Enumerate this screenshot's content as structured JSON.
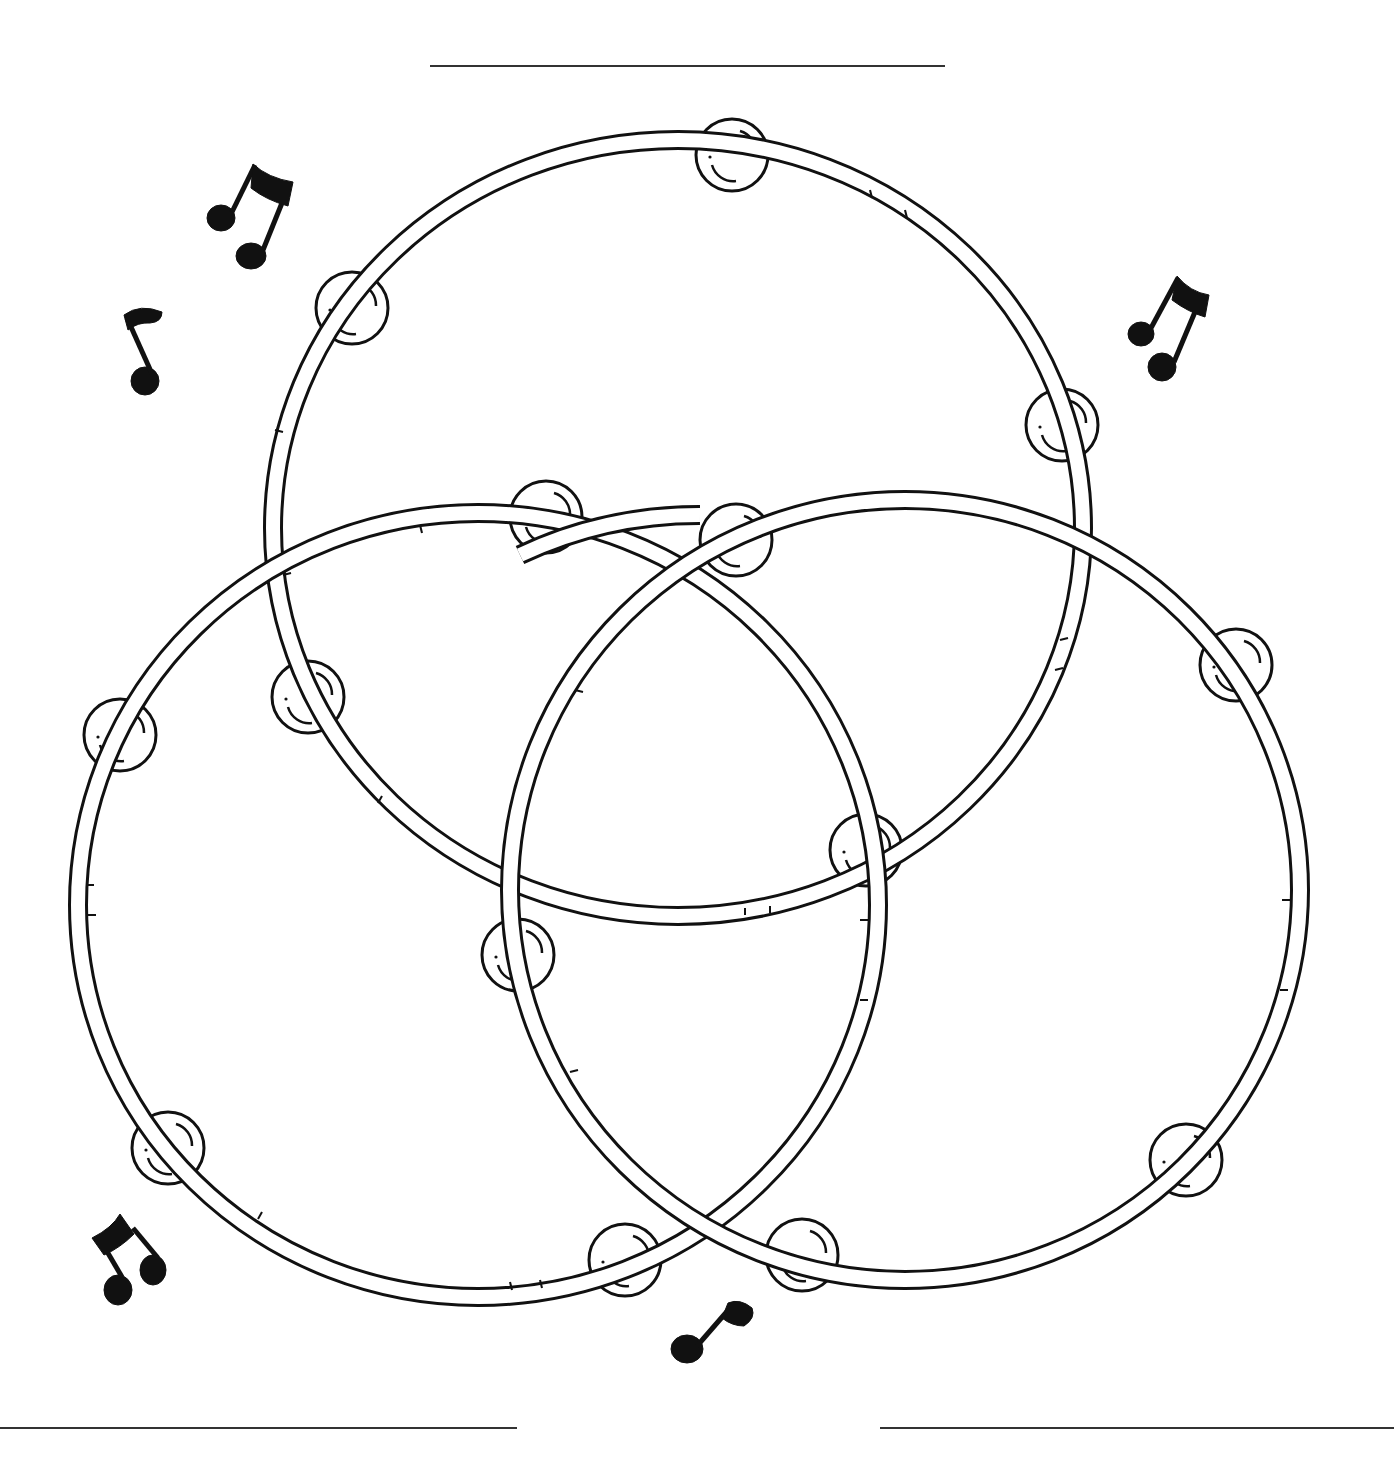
{
  "worksheet": {
    "type": "Venn diagram",
    "theme": "tambourines",
    "set_count": 3,
    "labels": {
      "top": "",
      "bottom_left": "",
      "bottom_right": ""
    },
    "label_lines": [
      {
        "id": "top",
        "x1": 430,
        "x2": 945,
        "y": 66
      },
      {
        "id": "bottom-left",
        "x1": 0,
        "x2": 517,
        "y": 1428
      },
      {
        "id": "bottom-right",
        "x1": 880,
        "x2": 1394,
        "y": 1428
      }
    ],
    "circles": [
      {
        "id": "top",
        "cx": 678,
        "cy": 528,
        "rx": 405,
        "ry": 388,
        "jingles": 7
      },
      {
        "id": "bottom-left",
        "cx": 478,
        "cy": 905,
        "rx": 400,
        "ry": 392,
        "jingles": 6
      },
      {
        "id": "bottom-right",
        "cx": 905,
        "cy": 890,
        "rx": 395,
        "ry": 390,
        "jingles": 6
      }
    ],
    "decorations": [
      {
        "name": "beamed-eighth-notes",
        "x": 250,
        "y": 215
      },
      {
        "name": "eighth-note",
        "x": 140,
        "y": 350
      },
      {
        "name": "beamed-eighth-notes",
        "x": 1165,
        "y": 330
      },
      {
        "name": "beamed-eighth-notes",
        "x": 125,
        "y": 1260
      },
      {
        "name": "eighth-note",
        "x": 710,
        "y": 1330
      }
    ],
    "colors": {
      "ink": "#111111",
      "paper": "#ffffff",
      "line": "#333333"
    }
  }
}
